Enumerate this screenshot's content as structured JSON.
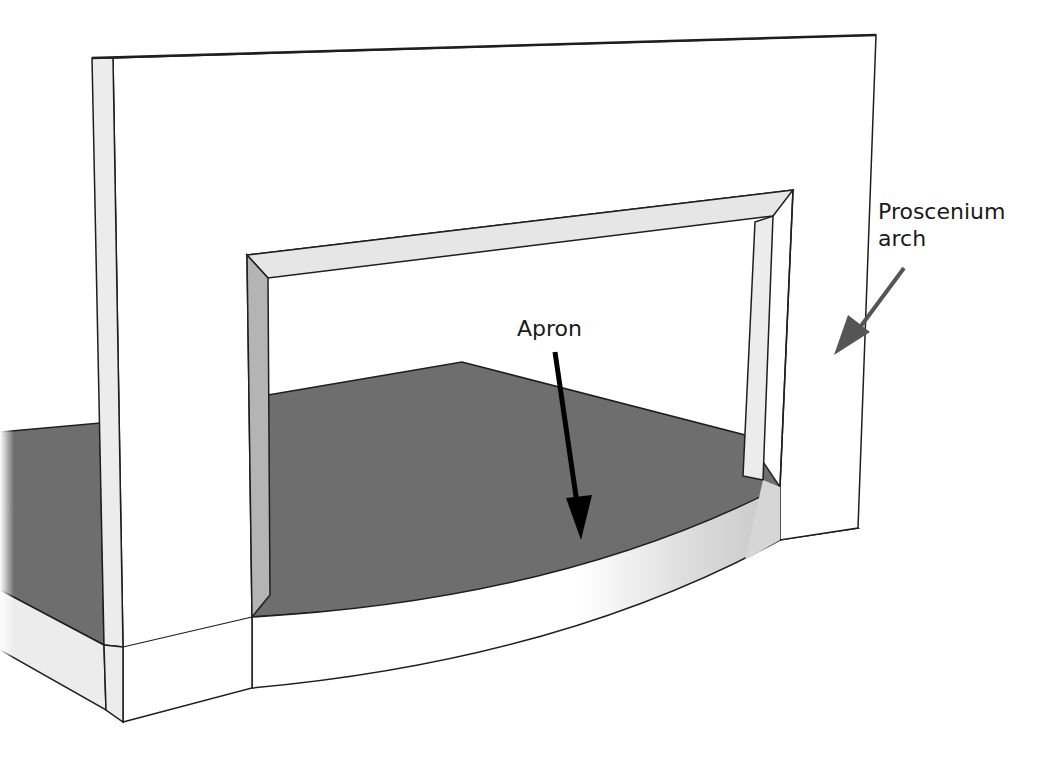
{
  "diagram": {
    "labels": {
      "proscenium": {
        "line1": "Proscenium",
        "line2": "arch"
      },
      "apron": "Apron"
    },
    "colors": {
      "floor": "#6e6e6e",
      "wall_face": "#ffffff",
      "wall_side": "#ececec",
      "reveal_shade": "#b4b4b4",
      "arch_top_reveal": "#e6e6e6",
      "apron_front": "#ffffff",
      "apron_side": "#d6d6d6",
      "outline": "#1e1e1e",
      "apron_arrow": "#000000",
      "proscenium_arrow": "#555555"
    }
  }
}
